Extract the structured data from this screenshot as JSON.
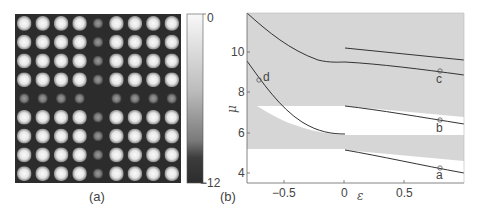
{
  "panel_a": {
    "label": "(a)",
    "grid_rows": 9,
    "grid_cols": 9,
    "dim_row_index": 4,
    "dim_col_index": 4,
    "colorbar": {
      "max_label": "0",
      "min_label": "−12",
      "range": [
        -12,
        0
      ]
    }
  },
  "panel_b": {
    "label": "(b)",
    "xlabel": "ε",
    "ylabel": "μ",
    "x_ticks": [
      "−0.5",
      "0",
      "0.5"
    ],
    "y_ticks": [
      "4",
      "6",
      "8",
      "10"
    ],
    "point_labels": {
      "a": "a",
      "b": "b",
      "c": "c",
      "d": "d"
    },
    "colors": {
      "gap_fill": "#d6d6d6",
      "band_fill": "#ffffff",
      "curve": "#333333"
    }
  },
  "chart_data": [
    {
      "type": "heatmap",
      "title": "(a)",
      "description": "9x9 lattice of bright spots; central column and central row attenuated (defect line)",
      "rows": 9,
      "cols": 9,
      "colorbar": {
        "min": -12,
        "max": 0,
        "tick_labels": [
          "0",
          "-12"
        ]
      },
      "bright_value": 0,
      "dim_column_value": -6,
      "dim_row_value": -6,
      "center_value": -12
    },
    {
      "type": "line",
      "title": "(b)",
      "xlabel": "ε",
      "ylabel": "μ",
      "xlim": [
        -0.85,
        1.0
      ],
      "ylim": [
        3.5,
        11.9
      ],
      "x_ticks": [
        -0.5,
        0,
        0.5
      ],
      "y_ticks": [
        4,
        6,
        8,
        10
      ],
      "grid": false,
      "regions": [
        {
          "name": "gap (gray)",
          "description": "gray shaded background = bandgap regions"
        },
        {
          "name": "band (white)",
          "x": [
            -0.85,
            1.0
          ],
          "y": [
            3.5,
            5.2
          ],
          "note": "lower band, upper edge rises from 5.2 to ~4.4 boundary for eps>0"
        },
        {
          "name": "band (white) right",
          "x": [
            0,
            1.0
          ],
          "y_top": [
            7.3,
            6.7
          ],
          "y_bottom": [
            5.9,
            5.9
          ]
        },
        {
          "name": "band (white) wedge left",
          "x": [
            -0.78,
            0
          ],
          "y_top": [
            7.3,
            7.3
          ],
          "y_bottom": [
            7.3,
            5.9
          ]
        }
      ],
      "series": [
        {
          "name": "defect mode upper-left (joins c)",
          "x": [
            -0.85,
            -0.5,
            -0.2,
            0
          ],
          "y": [
            11.9,
            10.6,
            9.6,
            9.4
          ]
        },
        {
          "name": "defect mode c",
          "x": [
            0,
            0.5,
            0.79,
            1.0
          ],
          "y": [
            9.4,
            9.1,
            8.9,
            8.7
          ]
        },
        {
          "name": "upper right branch",
          "x": [
            0,
            0.5,
            1.0
          ],
          "y": [
            10.1,
            9.9,
            9.5
          ]
        },
        {
          "name": "defect mode d",
          "x": [
            -0.85,
            -0.7,
            -0.5,
            -0.2,
            0
          ],
          "y": [
            9.4,
            8.6,
            7.5,
            6.3,
            6.0
          ]
        },
        {
          "name": "defect mode b",
          "x": [
            0,
            0.5,
            0.79,
            1.0
          ],
          "y": [
            7.3,
            6.9,
            6.6,
            6.4
          ]
        },
        {
          "name": "defect mode a",
          "x": [
            0,
            0.5,
            0.79,
            1.0
          ],
          "y": [
            5.1,
            4.6,
            4.2,
            4.0
          ]
        }
      ],
      "annotations": [
        {
          "label": "a",
          "x": 0.79,
          "y": 4.2
        },
        {
          "label": "b",
          "x": 0.79,
          "y": 6.6
        },
        {
          "label": "c",
          "x": 0.79,
          "y": 8.9
        },
        {
          "label": "d",
          "x": -0.71,
          "y": 8.6
        }
      ]
    }
  ]
}
